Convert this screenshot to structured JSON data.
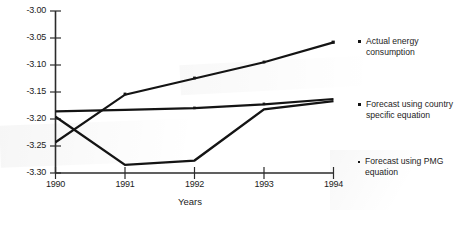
{
  "chart_data": {
    "type": "line",
    "title": "",
    "xlabel": "Years",
    "ylabel": "",
    "categories": [
      "1990",
      "1991",
      "1992",
      "1993",
      "1994"
    ],
    "x": [
      1990,
      1991,
      1992,
      1993,
      1994
    ],
    "xlim": [
      1990,
      1994
    ],
    "ylim": [
      -3.3,
      -3.0
    ],
    "yticks": [
      "-3.00",
      "-3.05",
      "-3.10",
      "-3.15",
      "-3.20",
      "-3.25",
      "-3.30"
    ],
    "ytick_values": [
      -3.0,
      -3.05,
      -3.1,
      -3.15,
      -3.2,
      -3.25,
      -3.3
    ],
    "xticks": [
      "1990",
      "1991",
      "1992",
      "1993",
      "1994"
    ],
    "grid": false,
    "legend_position": "right",
    "series": [
      {
        "name": "Actual energy consumption",
        "marker": "triangle",
        "values": [
          -3.243,
          -3.155,
          -3.125,
          -3.095,
          -3.058
        ]
      },
      {
        "name": "Forecast using country specific equation",
        "marker": "square",
        "values": [
          -3.186,
          -3.183,
          -3.18,
          -3.173,
          -3.163
        ]
      },
      {
        "name": "Forecast using PMG equation",
        "marker": "dot",
        "values": [
          -3.196,
          -3.285,
          -3.277,
          -3.182,
          -3.167
        ]
      }
    ]
  },
  "axis": {
    "x_title": "Years",
    "y_tick_labels": [
      "-3.00",
      "-3.05",
      "-3.10",
      "-3.15",
      "-3.20",
      "-3.25",
      "-3.30"
    ],
    "x_tick_labels": [
      "1990",
      "1991",
      "1992",
      "1993",
      "1994"
    ]
  },
  "legend": {
    "items": [
      {
        "label": "Actual energy consumption",
        "marker": "triangle-marker"
      },
      {
        "label": "Forecast using country specific equation",
        "marker": "square-marker"
      },
      {
        "label": "Forecast using PMG equation",
        "marker": "dot-marker"
      }
    ]
  },
  "colors": {
    "line": "#141414",
    "axis": "#2b2b2b",
    "text": "#1c1c1c",
    "background": "#ffffff"
  }
}
